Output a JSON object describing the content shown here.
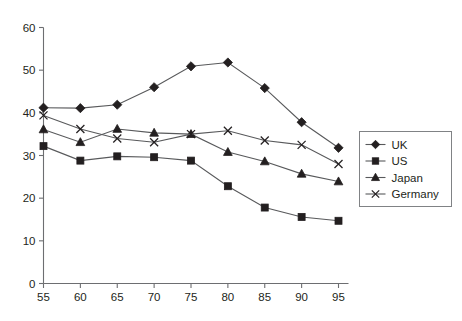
{
  "chart_data": {
    "type": "line",
    "title": "",
    "xlabel": "",
    "ylabel": "",
    "x": [
      55,
      60,
      65,
      70,
      75,
      80,
      85,
      90,
      95
    ],
    "xticklabels": [
      "55",
      "60",
      "65",
      "70",
      "75",
      "80",
      "85",
      "90",
      "95"
    ],
    "yticklabels": [
      "0",
      "10",
      "20",
      "30",
      "40",
      "50",
      "60"
    ],
    "yticks": [
      0,
      10,
      20,
      30,
      40,
      50,
      60
    ],
    "xlim": [
      55,
      95
    ],
    "ylim": [
      0,
      60
    ],
    "grid": false,
    "legend_position": "right",
    "series": [
      {
        "name": "UK",
        "marker": "diamond",
        "values": [
          41.2,
          41.1,
          41.9,
          46.0,
          50.9,
          51.8,
          45.8,
          37.8,
          31.8
        ]
      },
      {
        "name": "US",
        "marker": "square",
        "values": [
          32.2,
          28.8,
          29.8,
          29.6,
          28.8,
          22.8,
          17.8,
          15.6,
          14.7
        ]
      },
      {
        "name": "Japan",
        "marker": "triangle",
        "values": [
          36.1,
          33.1,
          36.2,
          35.3,
          35.0,
          30.8,
          28.6,
          25.7,
          23.9
        ]
      },
      {
        "name": "Germany",
        "marker": "cross",
        "values": [
          39.4,
          36.2,
          34.0,
          33.1,
          35.0,
          35.8,
          33.5,
          32.5,
          28.0
        ]
      }
    ]
  },
  "legend": {
    "items": [
      {
        "label": "UK"
      },
      {
        "label": "US"
      },
      {
        "label": "Japan"
      },
      {
        "label": "Germany"
      }
    ]
  }
}
